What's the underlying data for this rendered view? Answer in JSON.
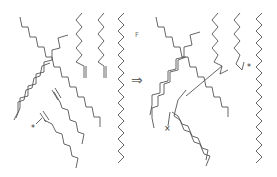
{
  "diagram": {
    "reaction_arrow": "⇒",
    "label_f": "F",
    "radical_mark": "*",
    "cross_mark": "×",
    "colors": {
      "stroke": "#555555",
      "background": "#ffffff"
    },
    "panels": [
      {
        "name": "reactants",
        "chains": 8,
        "terminal_alkenes": 4
      },
      {
        "name": "products",
        "chains": 8,
        "crosslinks": 2
      }
    ]
  }
}
